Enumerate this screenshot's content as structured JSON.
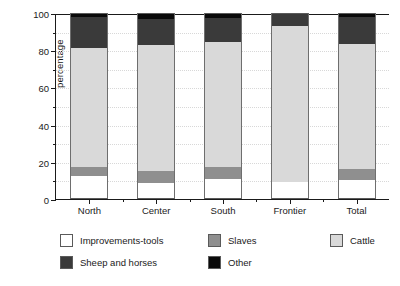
{
  "chart_data": {
    "type": "bar",
    "stacked": true,
    "stack_mode": "percent",
    "title": "",
    "xlabel": "",
    "ylabel": "percentage",
    "ylim": [
      0,
      100
    ],
    "ytick_values": [
      0,
      20,
      40,
      60,
      80,
      100
    ],
    "ytick_labels": [
      "0",
      "20",
      "40",
      "60",
      "80",
      "100"
    ],
    "yminor_values": [
      10,
      30,
      50,
      70,
      90
    ],
    "grid": true,
    "grid_axis": "y",
    "legend_position": "bottom",
    "categories": [
      "North",
      "Center",
      "South",
      "Frontier",
      "Total"
    ],
    "series": [
      {
        "name": "Improvements-tools",
        "color": "#ffffff",
        "values": [
          12.5,
          8.5,
          11.0,
          9.0,
          10.0
        ]
      },
      {
        "name": "Slaves",
        "color": "#8f8f8f",
        "values": [
          4.5,
          6.5,
          6.0,
          0.0,
          6.0
        ]
      },
      {
        "name": "Cattle",
        "color": "#d9d9d9",
        "values": [
          64.0,
          68.0,
          67.5,
          84.0,
          67.5
        ]
      },
      {
        "name": "Sheep and horses",
        "color": "#3a3a3a",
        "values": [
          17.0,
          14.0,
          13.0,
          6.5,
          14.5
        ]
      },
      {
        "name": "Other",
        "color": "#0a0a0a",
        "values": [
          2.0,
          3.0,
          2.5,
          0.5,
          2.0
        ]
      }
    ],
    "cumulative_tops": {
      "North": [
        12.5,
        17.0,
        81.0,
        98.0,
        100.0
      ],
      "Center": [
        8.5,
        15.0,
        83.0,
        97.0,
        100.0
      ],
      "South": [
        11.0,
        17.0,
        84.5,
        97.5,
        100.0
      ],
      "Frontier": [
        9.0,
        9.0,
        93.0,
        99.5,
        100.0
      ],
      "Total": [
        10.0,
        16.0,
        83.5,
        98.0,
        100.0
      ]
    }
  },
  "legend": {
    "items": [
      {
        "label": "Improvements-tools",
        "color": "#ffffff"
      },
      {
        "label": "Slaves",
        "color": "#8f8f8f"
      },
      {
        "label": "Cattle",
        "color": "#d9d9d9"
      },
      {
        "label": "Sheep and horses",
        "color": "#3a3a3a"
      },
      {
        "label": "Other",
        "color": "#0a0a0a"
      }
    ]
  }
}
